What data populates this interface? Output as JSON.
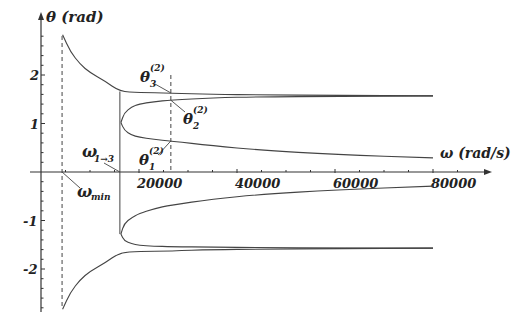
{
  "chart_data": {
    "type": "line",
    "title": "",
    "xlabel": "ω (rad/s)",
    "ylabel": "θ (rad)",
    "xlim": [
      0,
      90000
    ],
    "ylim": [
      -2.9,
      2.9
    ],
    "x_ticks": [
      20000,
      40000,
      60000,
      80000
    ],
    "x_tick_labels": [
      "20000",
      "40000",
      "60000",
      "80000"
    ],
    "y_ticks": [
      -2,
      -1,
      1,
      2
    ],
    "y_tick_labels": [
      "-2",
      "-1",
      "1",
      "2"
    ],
    "grid": false,
    "legend": null,
    "vertical_markers": [
      {
        "name": "omega_min",
        "x": 4300,
        "style": "dashed",
        "label": "ω_min"
      },
      {
        "name": "omega_1to3",
        "x": 16100,
        "style": "solid",
        "label": "ω_1→3",
        "y_range": [
          -1.28,
          1.66
        ]
      },
      {
        "name": "omega_sample",
        "x": 26500,
        "style": "dashed",
        "label": ""
      }
    ],
    "annotations": [
      {
        "text": "θ3^(2)",
        "target": [
          26500,
          1.63
        ]
      },
      {
        "text": "θ2^(2)",
        "target": [
          26500,
          1.48
        ]
      },
      {
        "text": "θ1^(2)",
        "target": [
          26500,
          0.64
        ]
      },
      {
        "text": "ω_1→3",
        "target": [
          16100,
          0
        ]
      },
      {
        "text": "ω_min",
        "target": [
          4300,
          0
        ]
      }
    ],
    "series": [
      {
        "name": "theta3_upper",
        "x": [
          4400,
          6000,
          8000,
          10000,
          13000,
          16100,
          20000,
          26500,
          35000,
          45000,
          60000,
          80000
        ],
        "y": [
          2.83,
          2.48,
          2.22,
          2.05,
          1.88,
          1.66,
          1.64,
          1.63,
          1.6,
          1.59,
          1.58,
          1.57
        ]
      },
      {
        "name": "theta2_upper",
        "x": [
          16300,
          17000,
          18500,
          20000,
          23000,
          26500,
          35000,
          45000,
          60000,
          80000
        ],
        "y": [
          1.02,
          1.22,
          1.34,
          1.4,
          1.45,
          1.48,
          1.53,
          1.55,
          1.56,
          1.57
        ]
      },
      {
        "name": "theta1_upper",
        "x": [
          16300,
          17000,
          18500,
          20000,
          23000,
          26500,
          35000,
          45000,
          60000,
          80000
        ],
        "y": [
          1.02,
          0.86,
          0.76,
          0.72,
          0.67,
          0.64,
          0.54,
          0.45,
          0.36,
          0.29
        ]
      },
      {
        "name": "theta3_lower",
        "x": [
          4400,
          6000,
          8000,
          10000,
          13000,
          16100,
          20000,
          26500,
          35000,
          45000,
          60000,
          80000
        ],
        "y": [
          -2.83,
          -2.48,
          -2.22,
          -2.05,
          -1.88,
          -1.66,
          -1.64,
          -1.63,
          -1.6,
          -1.59,
          -1.58,
          -1.57
        ]
      },
      {
        "name": "theta2_lower",
        "x": [
          16300,
          17000,
          18500,
          20000,
          23000,
          26500,
          35000,
          45000,
          60000,
          80000
        ],
        "y": [
          -1.28,
          -1.42,
          -1.48,
          -1.51,
          -1.53,
          -1.54,
          -1.55,
          -1.56,
          -1.57,
          -1.57
        ]
      },
      {
        "name": "theta1_lower",
        "x": [
          16300,
          17000,
          18500,
          20000,
          23000,
          26500,
          35000,
          45000,
          60000,
          80000
        ],
        "y": [
          -1.28,
          -1.06,
          -0.94,
          -0.86,
          -0.76,
          -0.68,
          -0.56,
          -0.46,
          -0.37,
          -0.29
        ]
      }
    ]
  },
  "labels": {
    "y_axis": "θ (rad)",
    "x_axis": "ω (rad/s)",
    "omega_min": "ω",
    "omega_min_sub": "min",
    "omega_1to3": "ω",
    "omega_1to3_sub": "1→3",
    "theta": "θ",
    "sup": "(2)",
    "sub1": "1",
    "sub2": "2",
    "sub3": "3"
  },
  "colors": {
    "axis": "#333333",
    "curve": "#444444",
    "text": "#222222"
  }
}
